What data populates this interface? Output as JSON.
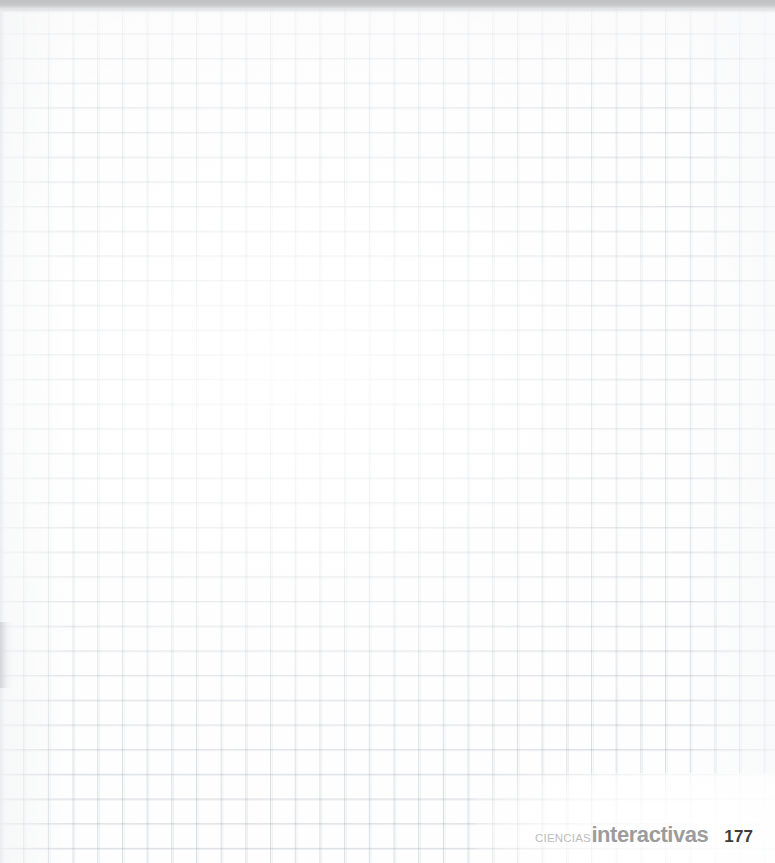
{
  "page": {
    "width": 775,
    "height": 863,
    "background_color": "#ffffff",
    "kind": "blank-graph-paper-page"
  },
  "grid": {
    "cell_size_px": 24.7,
    "line_color": "#dfe2e5",
    "columns": 31,
    "rows": 35,
    "style": "squared-notebook"
  },
  "scan_artifacts": {
    "top_band_color": "#c1c3c5",
    "top_band_height_px": 9,
    "left_margin_smudge": true
  },
  "body": {
    "content": "",
    "note": ""
  },
  "colophon": {
    "brand_primary": "CIENCIAS",
    "brand_secondary": "interactivas",
    "page_number": "177",
    "brand_primary_color": "#bcbcbc",
    "brand_secondary_color": "#9c9c9c",
    "page_number_color": "#3c3c3c"
  }
}
